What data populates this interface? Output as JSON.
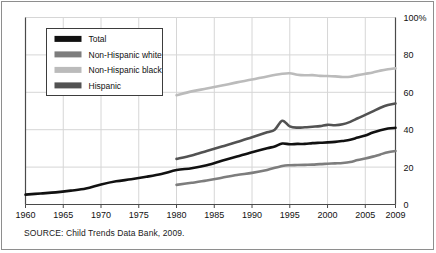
{
  "figure": {
    "source_note": "SOURCE: Child Trends Data Bank, 2009."
  },
  "chart_data": {
    "type": "line",
    "title": "",
    "subtitle": "",
    "xlabel": "",
    "ylabel": "",
    "xlim": [
      1960,
      2009
    ],
    "ylim": [
      0,
      100
    ],
    "grid": true,
    "legend_position": "top-left inside plot",
    "xticks": [
      1960,
      1965,
      1970,
      1975,
      1980,
      1985,
      1990,
      1995,
      2000,
      2005,
      2009
    ],
    "xtick_labels": [
      "1960",
      "1965",
      "1970",
      "1975",
      "1980",
      "1985",
      "1990",
      "1995",
      "2000",
      "2005",
      "2009"
    ],
    "yticks": [
      0,
      20,
      40,
      60,
      80,
      100
    ],
    "ytick_labels": [
      "0",
      "20",
      "40",
      "60",
      "80",
      "100%"
    ],
    "yaxis_side": "right",
    "series": [
      {
        "name": "Total",
        "color": "#111111",
        "x": [
          1960,
          1962,
          1964,
          1966,
          1968,
          1970,
          1972,
          1974,
          1976,
          1978,
          1980,
          1982,
          1984,
          1986,
          1988,
          1990,
          1992,
          1993,
          1994,
          1995,
          1996,
          1997,
          1998,
          1999,
          2000,
          2001,
          2002,
          2003,
          2004,
          2005,
          2006,
          2007,
          2008,
          2009
        ],
        "values": [
          5.3,
          5.9,
          6.5,
          7.4,
          8.5,
          10.7,
          12.4,
          13.5,
          14.8,
          16.3,
          18.4,
          19.4,
          21.0,
          23.4,
          25.7,
          28.0,
          30.1,
          31.0,
          32.6,
          32.2,
          32.4,
          32.4,
          32.8,
          33.0,
          33.2,
          33.5,
          34.0,
          34.6,
          35.8,
          36.9,
          38.5,
          39.7,
          40.6,
          41.0
        ]
      },
      {
        "name": "Non-Hispanic white",
        "color": "#7d7d7d",
        "x": [
          1980,
          1982,
          1984,
          1986,
          1988,
          1990,
          1992,
          1994,
          1995,
          1996,
          1997,
          1998,
          1999,
          2000,
          2001,
          2002,
          2003,
          2004,
          2005,
          2006,
          2007,
          2008,
          2009
        ],
        "values": [
          10.5,
          11.6,
          12.8,
          14.3,
          15.8,
          16.9,
          18.5,
          20.6,
          21.0,
          21.1,
          21.2,
          21.3,
          21.6,
          21.8,
          22.0,
          22.2,
          22.7,
          23.8,
          24.6,
          25.6,
          26.8,
          27.9,
          28.6
        ]
      },
      {
        "name": "Non-Hispanic black",
        "color": "#bbbbbb",
        "x": [
          1980,
          1982,
          1984,
          1986,
          1988,
          1990,
          1992,
          1994,
          1995,
          1996,
          1997,
          1998,
          1999,
          2000,
          2001,
          2002,
          2003,
          2004,
          2005,
          2006,
          2007,
          2008,
          2009
        ],
        "values": [
          58.4,
          60.5,
          62.0,
          63.6,
          65.3,
          66.8,
          68.5,
          69.9,
          70.2,
          69.4,
          69.1,
          69.2,
          68.8,
          68.7,
          68.5,
          68.2,
          68.3,
          69.2,
          69.9,
          70.6,
          71.6,
          72.3,
          72.8
        ]
      },
      {
        "name": "Hispanic",
        "color": "#525252",
        "x": [
          1980,
          1982,
          1984,
          1986,
          1988,
          1990,
          1992,
          1993,
          1994,
          1995,
          1996,
          1997,
          1998,
          1999,
          2000,
          2001,
          2002,
          2003,
          2004,
          2005,
          2006,
          2007,
          2008,
          2009
        ],
        "values": [
          24.4,
          26.2,
          28.6,
          31.0,
          33.4,
          36.0,
          38.6,
          40.0,
          44.8,
          41.8,
          41.1,
          41.3,
          41.6,
          41.9,
          42.6,
          42.4,
          42.9,
          44.2,
          46.1,
          47.9,
          49.8,
          51.7,
          53.2,
          54.0
        ]
      }
    ],
    "legend": [
      {
        "label": "Total",
        "color": "#111111"
      },
      {
        "label": "Non-Hispanic white",
        "color": "#7d7d7d"
      },
      {
        "label": "Non-Hispanic black",
        "color": "#bbbbbb"
      },
      {
        "label": "Hispanic",
        "color": "#525252"
      }
    ]
  }
}
